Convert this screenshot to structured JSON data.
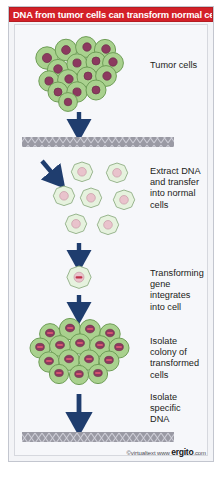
{
  "figure": {
    "title": "DNA from tumor cells can transform normal cells",
    "credit_copy": "©virtualtext",
    "credit_www": "www",
    "credit_brand": "ergito",
    "credit_tld": ".com",
    "colors": {
      "banner_bg": "#d32028",
      "banner_text": "#ffffff",
      "panel_bg": "#f3f4f7",
      "canvas_bg": "#f6f7fa",
      "tumor_cell_fill": "#a9d18e",
      "tumor_cell_stroke": "#6f9e57",
      "tumor_nucleus_fill": "#8c3a5f",
      "tumor_nucleus_stroke": "#6d2c4a",
      "normal_cell_fill": "#e6f2de",
      "normal_cell_stroke": "#8fae83",
      "normal_nucleus_fill": "#e9c3cc",
      "normal_nucleus_stroke": "#c79aa6",
      "gene_bar": "#c0304a",
      "arrow": "#1f3d6e",
      "dna_bar_bg": "#9a9aa4",
      "dna_bar_line": "#c9c9d2"
    },
    "stages": [
      {
        "id": "tumor-cells",
        "label": "Tumor cells"
      },
      {
        "id": "extract-dna",
        "label": "Extract DNA\nand transfer\ninto normal\ncells"
      },
      {
        "id": "transforming-gene",
        "label": "Transforming\ngene\nintegrates\ninto cell"
      },
      {
        "id": "isolate-colony",
        "label": "Isolate\ncolony of\ntransformed\ncells"
      },
      {
        "id": "isolate-dna",
        "label": "Isolate\nspecific\nDNA"
      }
    ],
    "elements": {
      "tumor_cluster_count": 16,
      "normal_cells_count": 8,
      "single_cell_count": 1,
      "transformed_colony_count": 14,
      "dna_bars": 2,
      "arrows": 5
    }
  }
}
